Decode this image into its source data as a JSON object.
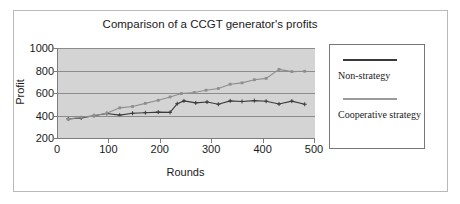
{
  "chart_data": {
    "type": "line",
    "title": "Comparison of a CCGT generator's profits",
    "xlabel": "Rounds",
    "ylabel": "Profit",
    "xlim": [
      0,
      500
    ],
    "ylim": [
      200,
      1000
    ],
    "xticks": [
      0,
      100,
      200,
      300,
      400,
      500
    ],
    "yticks": [
      200,
      400,
      600,
      800,
      1000
    ],
    "grid": "horizontal",
    "legend_position": "right-outside",
    "plot_background": "#d4d4d4",
    "series": [
      {
        "name": "Non-strategy",
        "color": "#3a3a3a",
        "marker": "plus",
        "x": [
          20,
          45,
          70,
          95,
          120,
          145,
          170,
          195,
          218,
          232,
          245,
          268,
          290,
          312,
          335,
          358,
          382,
          405,
          430,
          455,
          480
        ],
        "y": [
          370,
          378,
          398,
          418,
          403,
          420,
          425,
          430,
          428,
          505,
          530,
          512,
          520,
          500,
          530,
          525,
          532,
          527,
          502,
          528,
          500
        ]
      },
      {
        "name": "Cooperative strategy",
        "color": "#8e8e8e",
        "marker": "square",
        "x": [
          20,
          45,
          70,
          95,
          120,
          145,
          170,
          195,
          218,
          240,
          265,
          288,
          312,
          335,
          358,
          382,
          405,
          430,
          455,
          480
        ],
        "y": [
          368,
          385,
          400,
          420,
          468,
          480,
          508,
          535,
          565,
          595,
          605,
          625,
          640,
          678,
          690,
          718,
          730,
          810,
          790,
          793
        ]
      }
    ]
  },
  "legend": {
    "entries": [
      {
        "label": "Non-strategy",
        "color": "#3a3a3a"
      },
      {
        "label": "Cooperative strategy",
        "color": "#9a9a9a"
      }
    ]
  }
}
